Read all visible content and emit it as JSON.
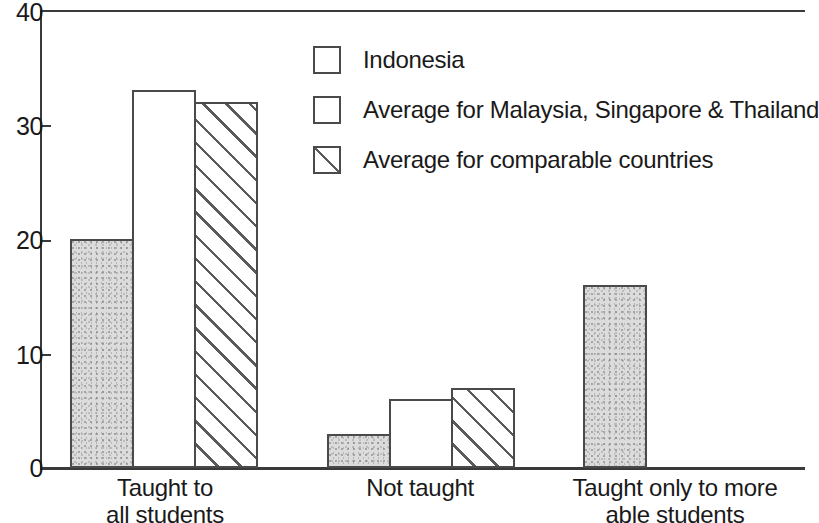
{
  "chart_data": {
    "type": "bar",
    "title": "",
    "subtitle": "",
    "xlabel": "",
    "ylabel": "",
    "ylim": [
      0,
      40
    ],
    "yticks": [
      0,
      10,
      20,
      30,
      40
    ],
    "ytick_labels": [
      "0",
      "10",
      "20",
      "30",
      "40"
    ],
    "grid": false,
    "legend_position": "top-center",
    "categories": [
      "Taught to\nall students",
      "Not taught",
      "Taught only to more\nable students"
    ],
    "series": [
      {
        "name": "Indonesia",
        "pattern": "stipple-gray",
        "values": [
          20,
          3,
          16
        ]
      },
      {
        "name": "Average for Malaysia, Singapore & Thailand",
        "pattern": "empty-white",
        "values": [
          33,
          6,
          null
        ]
      },
      {
        "name": "Average for comparable countries",
        "pattern": "diagonal-hatch",
        "values": [
          32,
          7,
          null
        ]
      }
    ]
  },
  "legend": {
    "items": [
      {
        "label": "Indonesia",
        "swatch": "stipple-swatch-icon"
      },
      {
        "label": "Average for Malaysia, Singapore & Thailand",
        "swatch": "empty-swatch-icon"
      },
      {
        "label": "Average for comparable countries",
        "swatch": "hatch-swatch-icon"
      }
    ]
  },
  "axis": {
    "y_labels": [
      "40",
      "30",
      "20",
      "10",
      "0"
    ]
  },
  "categories_display": [
    {
      "line1": "Taught to",
      "line2": "all students"
    },
    {
      "line1": "Not taught",
      "line2": ""
    },
    {
      "line1": "Taught only to more",
      "line2": "able students"
    }
  ],
  "colors": {
    "axis": "#3a3a3a",
    "bar_outline": "#4a4a4a",
    "stipple_fill": "#dcdcdc",
    "hatch_line": "#5a5a5a",
    "background": "#ffffff",
    "text": "#1a1a1a"
  }
}
